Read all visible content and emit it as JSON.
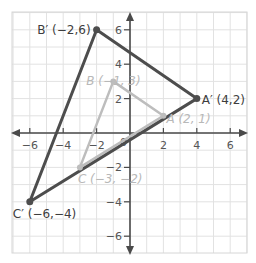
{
  "figure": {
    "type": "coordinate-plane-dilation",
    "grid": {
      "xmin": -7,
      "xmax": 7,
      "ymin": -7,
      "ymax": 7,
      "step": 1
    },
    "axes": {
      "x_ticks": [
        -6,
        -4,
        -2,
        2,
        4,
        6
      ],
      "y_ticks": [
        6,
        4,
        2,
        -2,
        -4,
        -6
      ],
      "x_tick_labels": [
        "−6",
        "−4",
        "−2",
        "2",
        "4",
        "6"
      ],
      "y_tick_labels": [
        "6",
        "4",
        "2",
        "−2",
        "−4",
        "−6"
      ],
      "origin_label": "0"
    },
    "colors": {
      "grid": "#e2e2e2",
      "axis": "#4a4a4a",
      "image_triangle": "#4d4d4d",
      "preimage_triangle": "#bdbdbd",
      "image_label": "#3d3d3d",
      "preimage_label": "#b8b8b8"
    },
    "image_triangle": {
      "name": "A'B'C'",
      "vertices": [
        {
          "name": "A'",
          "x": 4,
          "y": 2,
          "label": "A′ (4,2)"
        },
        {
          "name": "B'",
          "x": -2,
          "y": 6,
          "label": "B′ (−2,6)"
        },
        {
          "name": "C'",
          "x": -6,
          "y": -4,
          "label": "C′ (−6,−4)"
        }
      ]
    },
    "preimage_triangle": {
      "name": "ABC",
      "vertices": [
        {
          "name": "A",
          "x": 2,
          "y": 1,
          "label": "A (2, 1)"
        },
        {
          "name": "B",
          "x": -1,
          "y": 3,
          "label": "B (−1, 3)"
        },
        {
          "name": "C",
          "x": -3,
          "y": -2,
          "label": "C (−3, −2)"
        }
      ]
    }
  },
  "chart_data": {
    "type": "scatter",
    "title": "",
    "xlabel": "",
    "ylabel": "",
    "xlim": [
      -7,
      7
    ],
    "ylim": [
      -7,
      7
    ],
    "grid": true,
    "x_ticks": [
      -6,
      -4,
      -2,
      2,
      4,
      6
    ],
    "y_ticks": [
      -6,
      -4,
      -2,
      2,
      4,
      6
    ],
    "series": [
      {
        "name": "Triangle A'B'C'",
        "points": [
          [
            4,
            2
          ],
          [
            -2,
            6
          ],
          [
            -6,
            -4
          ]
        ],
        "labels": [
          "A′ (4,2)",
          "B′ (−2,6)",
          "C′ (−6,−4)"
        ],
        "closed": true
      },
      {
        "name": "Triangle ABC",
        "points": [
          [
            2,
            1
          ],
          [
            -1,
            3
          ],
          [
            -3,
            -2
          ]
        ],
        "labels": [
          "A (2, 1)",
          "B (−1, 3)",
          "C (−3, −2)"
        ],
        "closed": true
      }
    ]
  }
}
